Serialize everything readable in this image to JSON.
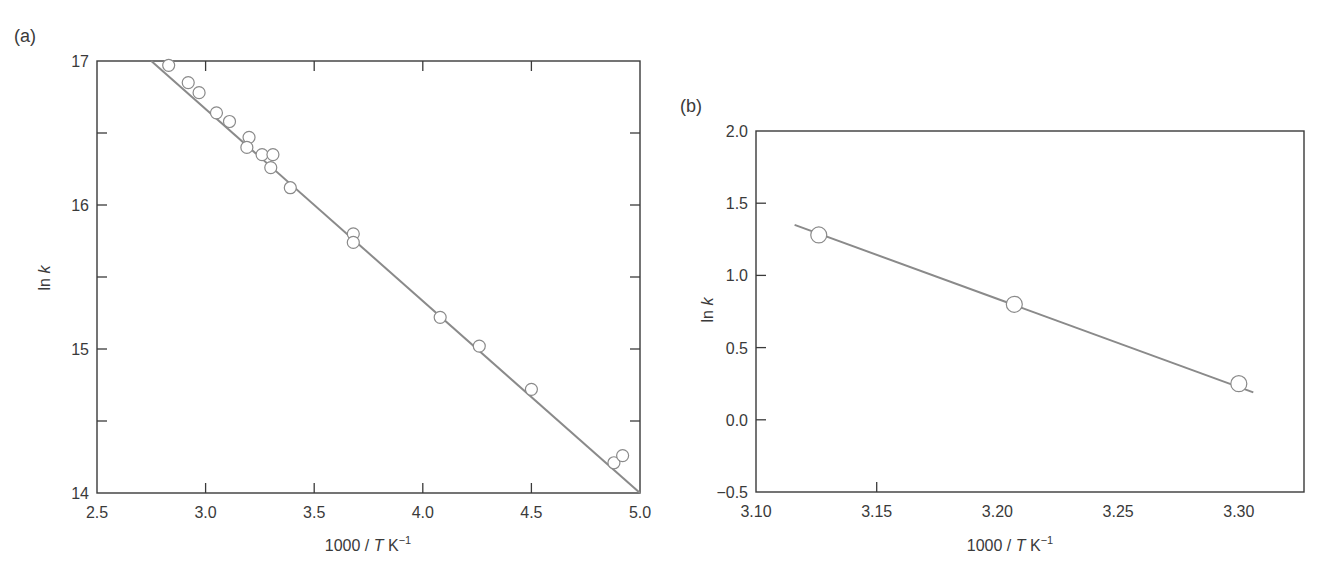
{
  "chart_data": [
    {
      "panel": "(a)",
      "type": "scatter",
      "title": "",
      "xlabel": "1000 / T K⁻¹",
      "ylabel": "ln k",
      "xlim": [
        2.5,
        5.0
      ],
      "ylim": [
        14,
        17
      ],
      "xticks": [
        "2.5",
        "3.0",
        "3.5",
        "4.0",
        "4.5",
        "5.0"
      ],
      "yticks": [
        "14",
        "15",
        "16",
        "17"
      ],
      "minor_yticks": [
        14.5,
        15.5,
        16.5
      ],
      "grid": false,
      "legend": null,
      "series": [
        {
          "name": "data",
          "marker": "open-circle",
          "x": [
            2.83,
            2.92,
            2.97,
            3.05,
            3.11,
            3.2,
            3.19,
            3.26,
            3.31,
            3.3,
            3.39,
            3.68,
            3.68,
            4.08,
            4.26,
            4.5,
            4.88,
            4.92
          ],
          "y": [
            16.97,
            16.85,
            16.78,
            16.64,
            16.58,
            16.47,
            16.4,
            16.35,
            16.35,
            16.26,
            16.12,
            15.8,
            15.74,
            15.22,
            15.02,
            14.72,
            14.21,
            14.26
          ]
        },
        {
          "name": "linear fit",
          "type": "line",
          "x": [
            2.75,
            5.0
          ],
          "y": [
            17.0,
            14.0
          ]
        }
      ]
    },
    {
      "panel": "(b)",
      "type": "scatter",
      "title": "",
      "xlabel": "1000 / T K⁻¹",
      "ylabel": "ln k",
      "xlim": [
        3.1,
        3.327
      ],
      "ylim": [
        -0.5,
        2.0
      ],
      "xticks": [
        "3.10",
        "3.15",
        "3.20",
        "3.25",
        "3.30"
      ],
      "yticks": [
        "−0.5",
        "0.0",
        "0.5",
        "1.0",
        "1.5",
        "2.0"
      ],
      "grid": false,
      "legend": null,
      "series": [
        {
          "name": "data",
          "marker": "open-circle",
          "x": [
            3.126,
            3.207,
            3.3
          ],
          "y": [
            1.28,
            0.8,
            0.25
          ]
        },
        {
          "name": "linear fit",
          "type": "line",
          "x": [
            3.116,
            3.306
          ],
          "y": [
            1.35,
            0.19
          ]
        }
      ]
    }
  ],
  "panels": {
    "a": {
      "label": "(a)",
      "xlabel_main": "1000 / ",
      "xlabel_T": "T",
      "xlabel_unit": " K",
      "xlabel_exp": "−1",
      "ylabel_ln": "ln ",
      "ylabel_k": "k"
    },
    "b": {
      "label": "(b)",
      "xlabel_main": "1000 / ",
      "xlabel_T": "T",
      "xlabel_unit": " K",
      "xlabel_exp": "−1",
      "ylabel_ln": "ln ",
      "ylabel_k": "k"
    }
  },
  "colors": {
    "axis": "#3a3a3a",
    "line": "#8a8a8a",
    "marker_stroke": "#8a8a8a",
    "marker_fill": "#ffffff"
  }
}
